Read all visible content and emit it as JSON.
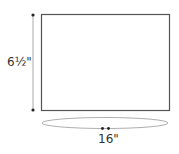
{
  "diagram": {
    "height_dimension": "6½\"",
    "width_dimension": "16\"",
    "colors": {
      "outline": "#555555",
      "dimension_line": "#aaaaaa",
      "dot": "#222222",
      "ellipse": "#999999",
      "text": "#333333"
    }
  }
}
